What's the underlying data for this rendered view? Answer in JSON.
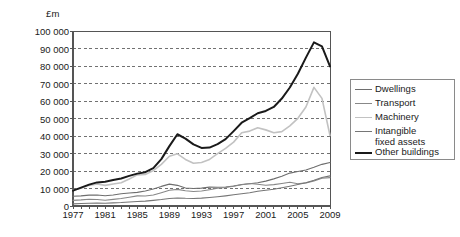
{
  "chart_data": {
    "type": "line",
    "title": "",
    "xlabel": "",
    "ylabel": "£m",
    "ylim": [
      0,
      100000
    ],
    "xlim": [
      1977,
      2009
    ],
    "grid": true,
    "legend_position": "right",
    "ytick_labels": [
      "100 000",
      "90 000",
      "80 000",
      "70 000",
      "60 000",
      "50 000",
      "40 000",
      "30 000",
      "20 000",
      "10 000",
      "0"
    ],
    "ytick_values": [
      100000,
      90000,
      80000,
      70000,
      60000,
      50000,
      40000,
      30000,
      20000,
      10000,
      0
    ],
    "xtick_labels": [
      "1977",
      "1981",
      "1985",
      "1989",
      "1993",
      "1997",
      "2001",
      "2005",
      "2009"
    ],
    "xtick_values": [
      1977,
      1981,
      1985,
      1989,
      1993,
      1997,
      2001,
      2005,
      2009
    ],
    "x": [
      1977,
      1978,
      1979,
      1980,
      1981,
      1982,
      1983,
      1984,
      1985,
      1986,
      1987,
      1988,
      1989,
      1990,
      1991,
      1992,
      1993,
      1994,
      1995,
      1996,
      1997,
      1998,
      1999,
      2000,
      2001,
      2002,
      2003,
      2004,
      2005,
      2006,
      2007,
      2008,
      2009
    ],
    "series": [
      {
        "name": "Dwellings",
        "color": "#6e6e6e",
        "width": 1.1,
        "values": [
          5600,
          5800,
          6200,
          6300,
          5900,
          6300,
          7000,
          7400,
          7800,
          8600,
          9700,
          11200,
          12500,
          11800,
          10300,
          10000,
          10200,
          10800,
          10700,
          10900,
          11400,
          12300,
          12700,
          13300,
          14200,
          15500,
          17000,
          18800,
          19700,
          20600,
          22100,
          23800,
          24900
        ]
      },
      {
        "name": "Transport",
        "color": "#888888",
        "width": 1.1,
        "values": [
          3200,
          3500,
          3900,
          3700,
          3300,
          3800,
          4300,
          5000,
          5800,
          5700,
          6300,
          7600,
          9000,
          9500,
          8700,
          8300,
          8600,
          9300,
          10100,
          10600,
          11300,
          12100,
          12900,
          12400,
          11900,
          12200,
          12900,
          13600,
          12700,
          13200,
          14300,
          15900,
          16200
        ]
      },
      {
        "name": "Machinery",
        "color": "#c2c2c2",
        "width": 1.6,
        "values": [
          9000,
          10200,
          11800,
          12600,
          11800,
          12600,
          13300,
          15400,
          17800,
          18000,
          20200,
          23800,
          28400,
          29800,
          26600,
          24400,
          24900,
          26600,
          29900,
          32900,
          36500,
          41900,
          42800,
          44700,
          43500,
          41900,
          42500,
          45800,
          50100,
          56600,
          67800,
          61500,
          40300
        ]
      },
      {
        "name": "Intangible fixed assets",
        "color": "#767676",
        "width": 1.1,
        "values": [
          1200,
          1400,
          1600,
          1700,
          1600,
          1800,
          2000,
          2300,
          2600,
          2800,
          3200,
          3700,
          4300,
          4600,
          4400,
          4300,
          4500,
          4900,
          5300,
          5800,
          6400,
          7000,
          7600,
          8400,
          9000,
          9600,
          10400,
          11300,
          12300,
          13300,
          14700,
          16300,
          17200
        ]
      },
      {
        "name": "Other buildings",
        "color": "#1a1a1a",
        "width": 2.0,
        "values": [
          8800,
          10500,
          12200,
          13500,
          13800,
          14800,
          15700,
          17200,
          18500,
          19300,
          21600,
          26800,
          34200,
          41000,
          38500,
          35200,
          33200,
          33400,
          35400,
          38200,
          42800,
          47600,
          50200,
          53000,
          54300,
          56600,
          61400,
          67700,
          75600,
          84800,
          93500,
          91200,
          79800
        ]
      }
    ],
    "legend_entries": [
      {
        "label": "Dwellings",
        "label_line2": "",
        "color": "#6e6e6e",
        "width": 1.4
      },
      {
        "label": "Transport",
        "label_line2": "",
        "color": "#888888",
        "width": 1.4
      },
      {
        "label": "Machinery",
        "label_line2": "",
        "color": "#c2c2c2",
        "width": 1.6
      },
      {
        "label": "Intangible",
        "label_line2": "fixed assets",
        "color": "#767676",
        "width": 1.4
      },
      {
        "label": "Other buildings",
        "label_line2": "",
        "color": "#1a1a1a",
        "width": 2.0
      }
    ],
    "axis_color": "#555555",
    "gridline_color": "#4d4d4d"
  }
}
